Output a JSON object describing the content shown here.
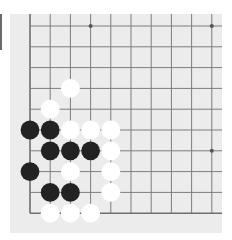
{
  "board": {
    "size_visible_cols": 10,
    "size_visible_rows": 10,
    "origin_x": 20,
    "origin_y": 12,
    "spacing_x": 20.2,
    "spacing_y": 20.8,
    "stone_radius": 9.4,
    "edges": {
      "left": true,
      "bottom": true,
      "top": false,
      "right": false
    },
    "colors": {
      "background": "#ececec",
      "line": "#7d7d7d",
      "edge_line": "#6f6f6f",
      "black_stone": "#222222",
      "white_stone": "#ffffff",
      "star_point": "#555555"
    },
    "star_points": [
      {
        "col": 3,
        "row": 0
      },
      {
        "col": 9,
        "row": 0
      },
      {
        "col": 9,
        "row": 6
      }
    ],
    "stones": [
      {
        "color": "white",
        "col": 2,
        "row": 3
      },
      {
        "color": "white",
        "col": 1,
        "row": 4
      },
      {
        "color": "black",
        "col": 0,
        "row": 5
      },
      {
        "color": "black",
        "col": 1,
        "row": 5
      },
      {
        "color": "white",
        "col": 2,
        "row": 5
      },
      {
        "color": "white",
        "col": 3,
        "row": 5
      },
      {
        "color": "white",
        "col": 4,
        "row": 5
      },
      {
        "color": "black",
        "col": 1,
        "row": 6
      },
      {
        "color": "black",
        "col": 2,
        "row": 6
      },
      {
        "color": "black",
        "col": 3,
        "row": 6
      },
      {
        "color": "white",
        "col": 4,
        "row": 6
      },
      {
        "color": "black",
        "col": 0,
        "row": 7
      },
      {
        "color": "white",
        "col": 2,
        "row": 7
      },
      {
        "color": "white",
        "col": 4,
        "row": 7
      },
      {
        "color": "black",
        "col": 1,
        "row": 8
      },
      {
        "color": "black",
        "col": 2,
        "row": 8
      },
      {
        "color": "white",
        "col": 4,
        "row": 8
      },
      {
        "color": "white",
        "col": 1,
        "row": 9
      },
      {
        "color": "white",
        "col": 2,
        "row": 9
      },
      {
        "color": "white",
        "col": 3,
        "row": 9
      }
    ]
  }
}
